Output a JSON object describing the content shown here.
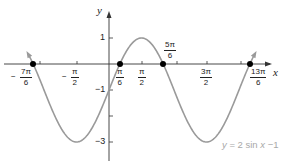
{
  "chart_data": {
    "type": "line",
    "title": "",
    "function": "y = 2 sin x - 1",
    "xlabel": "x",
    "ylabel": "y",
    "xlim_radians": [
      -1.35,
      2.3
    ],
    "xlim_note": "in multiples of pi: approximately -1.35pi to 2.3pi",
    "ylim": [
      -3.5,
      1.8
    ],
    "grid": false,
    "legend": "none",
    "x_tick_labels": [
      "-7π/6",
      "-π/2",
      "π/6",
      "π/2",
      "5π/6",
      "3π/2",
      "13π/6"
    ],
    "x_ticks_pi_multiples": [
      -1.1667,
      -1,
      -0.5,
      0.1667,
      0.5,
      0.8333,
      1,
      1.5,
      2,
      2.1667
    ],
    "y_tick_labels": [
      "1",
      "-1",
      "-3"
    ],
    "y_ticks": [
      1,
      -1,
      -2,
      -3
    ],
    "series": [
      {
        "name": "y = 2 sin x - 1",
        "color": "#9a9a9a",
        "x_pi": [
          -1.25,
          -1.1667,
          -1.0,
          -0.75,
          -0.5,
          -0.25,
          0,
          0.1667,
          0.25,
          0.5,
          0.75,
          0.8333,
          1.0,
          1.25,
          1.5,
          1.75,
          2.0,
          2.1667,
          2.25
        ],
        "y": [
          0.414,
          0,
          -1,
          -2.414,
          -3,
          -2.414,
          -1,
          0,
          0.414,
          1,
          0.414,
          0,
          -1,
          -2.414,
          -3,
          -2.414,
          -1,
          0,
          0.414
        ]
      }
    ],
    "highlighted_points": [
      {
        "label": "-7π/6",
        "x_pi": -1.1667,
        "y": 0
      },
      {
        "label": "π/6",
        "x_pi": 0.1667,
        "y": 0
      },
      {
        "label": "5π/6",
        "x_pi": 0.8333,
        "y": 0
      },
      {
        "label": "13π/6",
        "x_pi": 2.1667,
        "y": 0
      }
    ],
    "annotations": [
      "y = 2 sin x −1"
    ]
  },
  "labels": {
    "axis_x": "x",
    "axis_y": "y",
    "y_one": "1",
    "y_neg_one": "−1",
    "y_neg_three": "−3",
    "x_neg_7pi6": {
      "sign": "−",
      "num": "7π",
      "den": "6"
    },
    "x_neg_pi2": {
      "sign": "−",
      "num": "π",
      "den": "2"
    },
    "x_pi6": {
      "num": "π",
      "den": "6"
    },
    "x_pi2": {
      "num": "π",
      "den": "2"
    },
    "x_5pi6": {
      "num": "5π",
      "den": "6"
    },
    "x_3pi2": {
      "num": "3π",
      "den": "2"
    },
    "x_13pi6": {
      "num": "13π",
      "den": "6"
    },
    "equation": {
      "y": "y",
      "mid": " = 2 sin ",
      "x": "x",
      "end": " −1"
    }
  },
  "style": {
    "curve_color": "#9a9a9a",
    "axis_color": "#333333",
    "point_color": "#000000"
  }
}
